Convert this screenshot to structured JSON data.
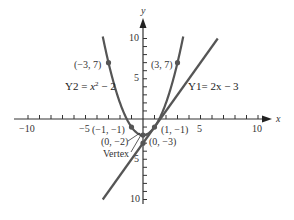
{
  "chart_data": {
    "type": "line",
    "title": "",
    "xlabel": "x",
    "ylabel": "y",
    "xlim": [
      -10,
      10
    ],
    "ylim": [
      -10,
      10
    ],
    "grid": false,
    "x_ticks": [
      -10,
      -5,
      5,
      10
    ],
    "y_ticks": [
      10,
      5,
      -5,
      -10
    ],
    "series": [
      {
        "name": "Y2 = x^2 - 2",
        "label": "Y2 = x² − 2",
        "kind": "parabola",
        "x": [
          -3.5,
          -3,
          -2,
          -1,
          0,
          1,
          2,
          3,
          3.5
        ],
        "values": [
          10.25,
          7,
          2,
          -1,
          -2,
          -1,
          2,
          7,
          10.25
        ]
      },
      {
        "name": "Y1 = 2x - 3",
        "label": "Y1= 2x − 3",
        "kind": "line",
        "x": [
          -3.5,
          6.5
        ],
        "values": [
          -10,
          10
        ]
      }
    ],
    "points": [
      {
        "x": -3,
        "y": 7,
        "label": "(−3, 7)"
      },
      {
        "x": 3,
        "y": 7,
        "label": "(3, 7)"
      },
      {
        "x": -1,
        "y": -1,
        "label": "(−1, −1)"
      },
      {
        "x": 1,
        "y": -1,
        "label": "(1, −1)"
      },
      {
        "x": 0,
        "y": -2,
        "label": "(0, −2)"
      },
      {
        "x": 0,
        "y": -3,
        "label": "(0, −3)"
      }
    ],
    "annotations": [
      {
        "text": "Vertex",
        "points_to": [
          0,
          -2
        ]
      }
    ]
  },
  "labels": {
    "x_axis": "x",
    "y_axis": "y",
    "tick_x_neg10": "−10",
    "tick_x_neg5": "−5",
    "tick_x_5": "5",
    "tick_x_10": "10",
    "tick_y_10": "10",
    "tick_y_5": "5",
    "tick_y_neg5": "5",
    "tick_y_neg10": "10",
    "pt_neg3_7": "(−3, 7)",
    "pt_3_7": "(3, 7)",
    "pt_neg1_neg1": "(−1, −1)",
    "pt_1_neg1": "(1, −1)",
    "pt_0_neg2": "(0, −2)",
    "pt_0_neg3": "(0, −3)",
    "vertex": "Vertex",
    "eq_y2_prefix": "Y2 = ",
    "eq_y2_x": "x",
    "eq_y2_exp": "2",
    "eq_y2_suffix": " − 2",
    "eq_y1": "Y1= 2x − 3"
  },
  "colors": {
    "curve": "#555555",
    "axis": "#333333",
    "point": "#555555"
  }
}
